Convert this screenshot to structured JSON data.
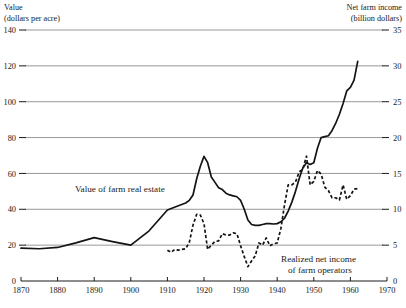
{
  "chart_data": {
    "type": "line",
    "title": "",
    "xlabel": "",
    "left_axis": {
      "label_line1": "Value",
      "label_line2": "(dollars per acre)",
      "ticks": [
        0,
        20,
        40,
        60,
        80,
        100,
        120,
        140
      ],
      "ylim": [
        0,
        140
      ],
      "tick_text": [
        "0",
        "20",
        "40",
        "60",
        "80",
        "100",
        "120",
        "140"
      ]
    },
    "right_axis": {
      "label_line1": "Net farm income",
      "label_line2": "(billion dollars)",
      "ticks": [
        0,
        5,
        10,
        15,
        20,
        25,
        30,
        35
      ],
      "ylim": [
        0,
        35
      ],
      "tick_text": [
        "0",
        "5",
        "10",
        "15",
        "20",
        "25",
        "30",
        "35"
      ]
    },
    "x_ticks": [
      1870,
      1880,
      1890,
      1900,
      1910,
      1920,
      1930,
      1940,
      1950,
      1960,
      1970
    ],
    "x_tick_text": [
      "1870",
      "1880",
      "1890",
      "1900",
      "1910",
      "1920",
      "1930",
      "1940",
      "1950",
      "1960",
      "1970"
    ],
    "xlim": [
      1870,
      1970
    ],
    "grid": true,
    "legend_position": "inline-annotation",
    "series": [
      {
        "name": "Value of farm real estate",
        "style": "solid",
        "axis": "left",
        "units": "dollars per acre",
        "label_text": "Value of farm real estate",
        "points": [
          [
            1870,
            18.3
          ],
          [
            1875,
            18.0
          ],
          [
            1880,
            18.7
          ],
          [
            1885,
            21.3
          ],
          [
            1890,
            24.2
          ],
          [
            1895,
            22.0
          ],
          [
            1900,
            20.0
          ],
          [
            1905,
            28.0
          ],
          [
            1910,
            39.6
          ],
          [
            1913,
            42.0
          ],
          [
            1915,
            43.5
          ],
          [
            1916,
            45.0
          ],
          [
            1917,
            48.0
          ],
          [
            1918,
            57.0
          ],
          [
            1919,
            64.0
          ],
          [
            1920,
            69.5
          ],
          [
            1921,
            66.0
          ],
          [
            1922,
            58.0
          ],
          [
            1923,
            55.0
          ],
          [
            1924,
            52.0
          ],
          [
            1925,
            51.0
          ],
          [
            1926,
            49.0
          ],
          [
            1927,
            48.0
          ],
          [
            1928,
            47.5
          ],
          [
            1929,
            47.0
          ],
          [
            1930,
            45.0
          ],
          [
            1931,
            40.0
          ],
          [
            1932,
            34.0
          ],
          [
            1933,
            31.5
          ],
          [
            1934,
            31.0
          ],
          [
            1935,
            31.0
          ],
          [
            1936,
            31.5
          ],
          [
            1937,
            32.0
          ],
          [
            1938,
            32.0
          ],
          [
            1939,
            31.8
          ],
          [
            1940,
            32.0
          ],
          [
            1941,
            33.0
          ],
          [
            1942,
            35.0
          ],
          [
            1943,
            39.0
          ],
          [
            1944,
            44.0
          ],
          [
            1945,
            50.0
          ],
          [
            1946,
            57.0
          ],
          [
            1947,
            63.0
          ],
          [
            1948,
            66.0
          ],
          [
            1949,
            65.0
          ],
          [
            1950,
            66.0
          ],
          [
            1951,
            74.0
          ],
          [
            1952,
            80.0
          ],
          [
            1953,
            80.5
          ],
          [
            1954,
            81.0
          ],
          [
            1955,
            84.0
          ],
          [
            1956,
            88.0
          ],
          [
            1957,
            93.0
          ],
          [
            1958,
            99.0
          ],
          [
            1959,
            106.0
          ],
          [
            1960,
            108.0
          ],
          [
            1961,
            112.0
          ],
          [
            1962,
            122.5
          ]
        ]
      },
      {
        "name": "Realized net income of farm operators",
        "style": "dashed",
        "axis": "right",
        "units": "billion dollars",
        "label_line1": "Realized net income",
        "label_line2": "of farm operators",
        "points": [
          [
            1910,
            4.3
          ],
          [
            1911,
            4.0
          ],
          [
            1912,
            4.4
          ],
          [
            1913,
            4.3
          ],
          [
            1914,
            4.4
          ],
          [
            1915,
            4.5
          ],
          [
            1916,
            5.4
          ],
          [
            1917,
            7.8
          ],
          [
            1918,
            9.3
          ],
          [
            1919,
            9.2
          ],
          [
            1920,
            8.0
          ],
          [
            1921,
            4.4
          ],
          [
            1922,
            5.0
          ],
          [
            1923,
            5.5
          ],
          [
            1924,
            5.6
          ],
          [
            1925,
            6.6
          ],
          [
            1926,
            6.4
          ],
          [
            1927,
            6.4
          ],
          [
            1928,
            6.7
          ],
          [
            1929,
            6.6
          ],
          [
            1930,
            4.9
          ],
          [
            1931,
            3.4
          ],
          [
            1932,
            2.0
          ],
          [
            1933,
            2.8
          ],
          [
            1934,
            3.5
          ],
          [
            1935,
            5.3
          ],
          [
            1936,
            5.0
          ],
          [
            1937,
            6.0
          ],
          [
            1938,
            4.9
          ],
          [
            1939,
            5.2
          ],
          [
            1940,
            5.3
          ],
          [
            1941,
            7.3
          ],
          [
            1942,
            10.6
          ],
          [
            1943,
            13.4
          ],
          [
            1944,
            13.4
          ],
          [
            1945,
            13.8
          ],
          [
            1946,
            15.2
          ],
          [
            1947,
            15.6
          ],
          [
            1948,
            17.4
          ],
          [
            1949,
            13.4
          ],
          [
            1950,
            13.9
          ],
          [
            1951,
            15.4
          ],
          [
            1952,
            14.9
          ],
          [
            1953,
            13.1
          ],
          [
            1954,
            12.6
          ],
          [
            1955,
            11.6
          ],
          [
            1956,
            11.6
          ],
          [
            1957,
            11.3
          ],
          [
            1958,
            13.4
          ],
          [
            1959,
            11.4
          ],
          [
            1960,
            11.9
          ],
          [
            1961,
            12.8
          ],
          [
            1962,
            12.9
          ]
        ]
      }
    ]
  }
}
